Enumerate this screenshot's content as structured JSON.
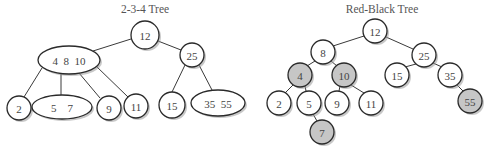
{
  "diagrams": [
    {
      "id": "tree234",
      "title": "2-3-4 Tree",
      "title_pos": [
        145,
        13
      ],
      "nodes": [
        {
          "key": "n12",
          "label": "12",
          "shape": "circle",
          "cx": 145,
          "cy": 35,
          "rx": 14,
          "ry": 14,
          "fill": "white"
        },
        {
          "key": "n25",
          "label": "25",
          "shape": "circle",
          "cx": 192,
          "cy": 55,
          "rx": 12,
          "ry": 12,
          "fill": "white"
        },
        {
          "key": "n4_8_10",
          "label": "4  8  10",
          "shape": "ellipse",
          "cx": 69,
          "cy": 60,
          "rx": 31,
          "ry": 14,
          "fill": "white"
        },
        {
          "key": "n2",
          "label": "2",
          "shape": "circle",
          "cx": 19,
          "cy": 108,
          "rx": 12,
          "ry": 12,
          "fill": "white"
        },
        {
          "key": "n5_7",
          "label": "5    7",
          "shape": "ellipse",
          "cx": 62,
          "cy": 107,
          "rx": 30,
          "ry": 12,
          "fill": "white"
        },
        {
          "key": "n9",
          "label": "9",
          "shape": "circle",
          "cx": 109,
          "cy": 108,
          "rx": 12,
          "ry": 12,
          "fill": "white"
        },
        {
          "key": "n11",
          "label": "11",
          "shape": "circle",
          "cx": 136,
          "cy": 106,
          "rx": 12,
          "ry": 12,
          "fill": "white"
        },
        {
          "key": "n15",
          "label": "15",
          "shape": "circle",
          "cx": 172,
          "cy": 105,
          "rx": 13,
          "ry": 13,
          "fill": "white"
        },
        {
          "key": "n35_55",
          "label": "35  55",
          "shape": "ellipse",
          "cx": 218,
          "cy": 103,
          "rx": 27,
          "ry": 13,
          "fill": "white"
        }
      ],
      "edges": [
        {
          "from": "n12",
          "to": "n4_8_10",
          "x1": 131,
          "y1": 39,
          "x2": 93,
          "y2": 51
        },
        {
          "from": "n12",
          "to": "n25",
          "x1": 158,
          "y1": 41,
          "x2": 181,
          "y2": 50
        },
        {
          "from": "n4_8_10",
          "to": "n2",
          "x1": 42,
          "y1": 68,
          "x2": 24,
          "y2": 97
        },
        {
          "from": "n4_8_10",
          "to": "n5_7",
          "x1": 61,
          "y1": 74,
          "x2": 61,
          "y2": 95
        },
        {
          "from": "n4_8_10",
          "to": "n9",
          "x1": 79,
          "y1": 73,
          "x2": 100,
          "y2": 98
        },
        {
          "from": "n4_8_10",
          "to": "n11",
          "x1": 96,
          "y1": 66,
          "x2": 128,
          "y2": 97
        },
        {
          "from": "n25",
          "to": "n15",
          "x1": 185,
          "y1": 65,
          "x2": 172,
          "y2": 92
        },
        {
          "from": "n25",
          "to": "n35_55",
          "x1": 199,
          "y1": 65,
          "x2": 212,
          "y2": 90
        }
      ]
    },
    {
      "id": "rbtree",
      "title": "Red-Black Tree",
      "title_pos": [
        382,
        13
      ],
      "nodes": [
        {
          "key": "r12",
          "label": "12",
          "shape": "circle",
          "cx": 375,
          "cy": 31,
          "rx": 12,
          "ry": 12,
          "fill": "white"
        },
        {
          "key": "r8",
          "label": "8",
          "shape": "circle",
          "cx": 323,
          "cy": 52,
          "rx": 12,
          "ry": 12,
          "fill": "white"
        },
        {
          "key": "r25",
          "label": "25",
          "shape": "circle",
          "cx": 424,
          "cy": 55,
          "rx": 12,
          "ry": 12,
          "fill": "white"
        },
        {
          "key": "r4",
          "label": "4",
          "shape": "circle",
          "cx": 300,
          "cy": 75,
          "rx": 12,
          "ry": 12,
          "fill": "gray"
        },
        {
          "key": "r10",
          "label": "10",
          "shape": "circle",
          "cx": 344,
          "cy": 75,
          "rx": 12,
          "ry": 12,
          "fill": "gray"
        },
        {
          "key": "r15",
          "label": "15",
          "shape": "circle",
          "cx": 397,
          "cy": 75,
          "rx": 12,
          "ry": 12,
          "fill": "white"
        },
        {
          "key": "r35",
          "label": "35",
          "shape": "circle",
          "cx": 450,
          "cy": 75,
          "rx": 12,
          "ry": 12,
          "fill": "white"
        },
        {
          "key": "r2",
          "label": "2",
          "shape": "circle",
          "cx": 279,
          "cy": 103,
          "rx": 12,
          "ry": 12,
          "fill": "white"
        },
        {
          "key": "r5",
          "label": "5",
          "shape": "circle",
          "cx": 309,
          "cy": 103,
          "rx": 12,
          "ry": 12,
          "fill": "white"
        },
        {
          "key": "r9",
          "label": "9",
          "shape": "circle",
          "cx": 337,
          "cy": 103,
          "rx": 12,
          "ry": 12,
          "fill": "white"
        },
        {
          "key": "r11",
          "label": "11",
          "shape": "circle",
          "cx": 371,
          "cy": 103,
          "rx": 12,
          "ry": 12,
          "fill": "white"
        },
        {
          "key": "r55",
          "label": "55",
          "shape": "circle",
          "cx": 470,
          "cy": 101,
          "rx": 12,
          "ry": 12,
          "fill": "gray"
        },
        {
          "key": "r7",
          "label": "7",
          "shape": "circle",
          "cx": 322,
          "cy": 132,
          "rx": 12,
          "ry": 12,
          "fill": "gray"
        }
      ],
      "edges": [
        {
          "from": "r12",
          "to": "r8",
          "x1": 364,
          "y1": 36,
          "x2": 333,
          "y2": 46
        },
        {
          "from": "r12",
          "to": "r25",
          "x1": 386,
          "y1": 37,
          "x2": 413,
          "y2": 49
        },
        {
          "from": "r8",
          "to": "r4",
          "x1": 315,
          "y1": 61,
          "x2": 307,
          "y2": 66
        },
        {
          "from": "r8",
          "to": "r10",
          "x1": 331,
          "y1": 61,
          "x2": 337,
          "y2": 66
        },
        {
          "from": "r25",
          "to": "r15",
          "x1": 416,
          "y1": 64,
          "x2": 405,
          "y2": 67
        },
        {
          "from": "r25",
          "to": "r35",
          "x1": 433,
          "y1": 63,
          "x2": 442,
          "y2": 67
        },
        {
          "from": "r4",
          "to": "r2",
          "x1": 293,
          "y1": 85,
          "x2": 285,
          "y2": 93
        },
        {
          "from": "r4",
          "to": "r5",
          "x1": 305,
          "y1": 86,
          "x2": 306,
          "y2": 91
        },
        {
          "from": "r10",
          "to": "r9",
          "x1": 340,
          "y1": 86,
          "x2": 339,
          "y2": 91
        },
        {
          "from": "r10",
          "to": "r11",
          "x1": 351,
          "y1": 85,
          "x2": 364,
          "y2": 93
        },
        {
          "from": "r35",
          "to": "r55",
          "x1": 457,
          "y1": 85,
          "x2": 463,
          "y2": 91
        },
        {
          "from": "r5",
          "to": "r7",
          "x1": 313,
          "y1": 114,
          "x2": 317,
          "y2": 121
        }
      ]
    }
  ],
  "colors": {
    "white_fill": "#ffffff",
    "gray_fill": "#c6c6c6",
    "stroke": "#2a2a2a",
    "text": "#444444",
    "title": "#555555"
  }
}
